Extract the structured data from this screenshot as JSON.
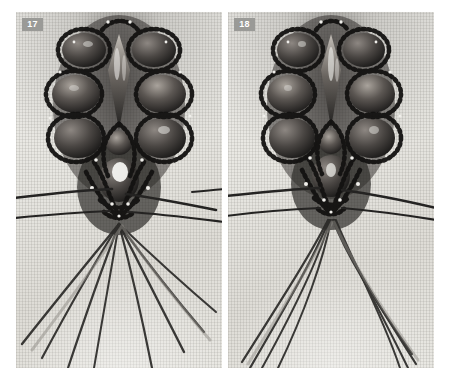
{
  "page": {
    "background_color": "#ffffff",
    "width": 450,
    "height": 386
  },
  "palette": {
    "fabric_light": "#efeeea",
    "fabric_mid": "#e0ded8",
    "fabric_shadow": "#b9b7b1",
    "bead_dark": "#1d1c1b",
    "bead_mid": "#474441",
    "bead_highlight": "#f2f1ee",
    "thread": "#2b2a28",
    "badge_background": "#9a9a97",
    "badge_text": "#ffffff"
  },
  "panels": [
    {
      "id": "panel-17",
      "step_number": "17",
      "badge_label": "17",
      "caption": "",
      "description": "Grayscale close-up photograph of a beaded macrame pendant in progress on woven fabric. Faceted crystal beads outlined with small dark seed beads form a symmetrical column; multiple dark threads fan outward and downward from the pendant tip.",
      "thread_count": 8,
      "has_horizontal_threads": true
    },
    {
      "id": "panel-18",
      "step_number": "18",
      "badge_label": "18",
      "caption": "",
      "description": "Grayscale close-up photograph of the same beaded macrame pendant one step later. The working threads are drawn together more tightly below the pendant tip and splay into two narrow bundles toward the lower corners.",
      "thread_count": 8,
      "has_horizontal_threads": true
    }
  ]
}
